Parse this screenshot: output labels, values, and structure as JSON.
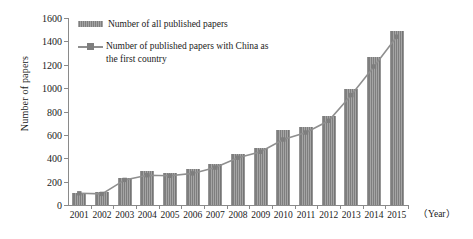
{
  "chart_data": {
    "type": "bar",
    "title": "",
    "xlabel": "（Year）",
    "ylabel": "Number of papers",
    "categories": [
      "2001",
      "2002",
      "2003",
      "2004",
      "2005",
      "2006",
      "2007",
      "2008",
      "2009",
      "2010",
      "2011",
      "2012",
      "2013",
      "2014",
      "2015"
    ],
    "ylim": [
      0,
      1600
    ],
    "ytick_values": [
      0,
      200,
      400,
      600,
      800,
      1000,
      1200,
      1400,
      1600
    ],
    "ytick_labels": [
      "0",
      "200",
      "400",
      "600",
      "800",
      "1000",
      "1200",
      "1400",
      "1600"
    ],
    "grid": false,
    "legend_position": "top-left inside",
    "series": [
      {
        "name": "Number of all published papers",
        "kind": "bar",
        "color": "#7e7e7e",
        "values": [
          105,
          115,
          230,
          295,
          275,
          305,
          350,
          440,
          490,
          640,
          665,
          760,
          990,
          1270,
          1490
        ]
      },
      {
        "name": "Number of published papers with China as the first country",
        "kind": "line",
        "color": "#8f8f8f",
        "values": [
          100,
          95,
          215,
          255,
          250,
          270,
          320,
          405,
          455,
          560,
          620,
          720,
          940,
          1185,
          1440
        ]
      }
    ]
  },
  "legend": {
    "items": [
      {
        "label": "Number of all published papers",
        "marker": "bar-swatch"
      },
      {
        "label": "Number of published papers with China as\nthe first country",
        "marker": "line-marker-swatch"
      }
    ]
  },
  "axes": {
    "y_title": "Number of papers",
    "x_unit": "（Year）"
  }
}
